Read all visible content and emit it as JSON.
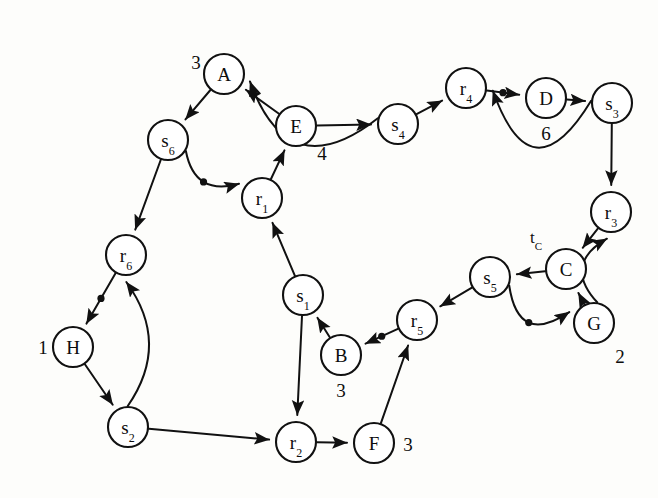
{
  "figure": {
    "width": 658,
    "height": 498,
    "background_color": "#fdfdfb",
    "stroke_color": "#111111"
  },
  "nodes": [
    {
      "id": "A",
      "label": "A",
      "sub": "",
      "x": 224,
      "y": 74,
      "r": 20
    },
    {
      "id": "s6",
      "label": "s",
      "sub": "6",
      "x": 168,
      "y": 140,
      "r": 20
    },
    {
      "id": "E",
      "label": "E",
      "sub": "",
      "x": 296,
      "y": 126,
      "r": 20
    },
    {
      "id": "s4",
      "label": "s",
      "sub": "4",
      "x": 398,
      "y": 124,
      "r": 20
    },
    {
      "id": "r4",
      "label": "r",
      "sub": "4",
      "x": 466,
      "y": 88,
      "r": 20
    },
    {
      "id": "D",
      "label": "D",
      "sub": "",
      "x": 546,
      "y": 98,
      "r": 20
    },
    {
      "id": "s3",
      "label": "s",
      "sub": "3",
      "x": 612,
      "y": 103,
      "r": 20
    },
    {
      "id": "r3",
      "label": "r",
      "sub": "3",
      "x": 611,
      "y": 212,
      "r": 20
    },
    {
      "id": "C",
      "label": "C",
      "sub": "",
      "x": 566,
      "y": 269,
      "r": 20
    },
    {
      "id": "s5",
      "label": "s",
      "sub": "5",
      "x": 490,
      "y": 277,
      "r": 20
    },
    {
      "id": "G",
      "label": "G",
      "sub": "",
      "x": 594,
      "y": 323,
      "r": 20
    },
    {
      "id": "r1",
      "label": "r",
      "sub": "1",
      "x": 262,
      "y": 198,
      "r": 20
    },
    {
      "id": "r6",
      "label": "r",
      "sub": "6",
      "x": 126,
      "y": 255,
      "r": 20
    },
    {
      "id": "H",
      "label": "H",
      "sub": "",
      "x": 73,
      "y": 347,
      "r": 20
    },
    {
      "id": "s2",
      "label": "s",
      "sub": "2",
      "x": 128,
      "y": 427,
      "r": 20
    },
    {
      "id": "s1",
      "label": "s",
      "sub": "1",
      "x": 303,
      "y": 295,
      "r": 20
    },
    {
      "id": "B",
      "label": "B",
      "sub": "",
      "x": 341,
      "y": 355,
      "r": 20
    },
    {
      "id": "r5",
      "label": "r",
      "sub": "5",
      "x": 417,
      "y": 320,
      "r": 20
    },
    {
      "id": "r2",
      "label": "r",
      "sub": "2",
      "x": 296,
      "y": 442,
      "r": 20
    },
    {
      "id": "F",
      "label": "F",
      "sub": "",
      "x": 374,
      "y": 443,
      "r": 20
    }
  ],
  "annotations": [
    {
      "id": "ann-A",
      "text": "3",
      "x": 196,
      "y": 62,
      "node": "A"
    },
    {
      "id": "ann-E",
      "text": "4",
      "x": 322,
      "y": 153,
      "node": "E"
    },
    {
      "id": "ann-D",
      "text": "6",
      "x": 546,
      "y": 133,
      "node": "D"
    },
    {
      "id": "ann-H",
      "text": "1",
      "x": 43,
      "y": 347,
      "node": "H"
    },
    {
      "id": "ann-B",
      "text": "3",
      "x": 341,
      "y": 390,
      "node": "B"
    },
    {
      "id": "ann-F",
      "text": "3",
      "x": 408,
      "y": 444,
      "node": "F"
    },
    {
      "id": "ann-G",
      "text": "2",
      "x": 620,
      "y": 356,
      "node": "G"
    }
  ],
  "tags": [
    {
      "id": "tag-C",
      "text": "t",
      "sub": "C",
      "x": 536,
      "y": 237,
      "node": "C"
    }
  ],
  "edges": [
    {
      "id": "A-s6",
      "from": "A",
      "to": "s6",
      "dot": false
    },
    {
      "id": "s6-r1",
      "from": "s6",
      "to": "r1",
      "dot": true
    },
    {
      "id": "s6-r6",
      "from": "s6",
      "to": "r6",
      "dot": false
    },
    {
      "id": "E-A",
      "from": "E",
      "to": "A",
      "dot": false
    },
    {
      "id": "r1-E",
      "from": "r1",
      "to": "E",
      "dot": false
    },
    {
      "id": "E-s4",
      "from": "E",
      "to": "s4",
      "dot": false
    },
    {
      "id": "s4-A",
      "from": "s4",
      "to": "A",
      "dot": false
    },
    {
      "id": "s4-r4",
      "from": "s4",
      "to": "r4",
      "dot": false
    },
    {
      "id": "r4-D",
      "from": "r4",
      "to": "D",
      "dot": true
    },
    {
      "id": "D-s3",
      "from": "D",
      "to": "s3",
      "dot": false
    },
    {
      "id": "s3-r4",
      "from": "s3",
      "to": "r4",
      "dot": false
    },
    {
      "id": "s3-r3",
      "from": "s3",
      "to": "r3",
      "dot": false
    },
    {
      "id": "r3-C",
      "from": "r3",
      "to": "C",
      "dot": false
    },
    {
      "id": "C-s5",
      "from": "C",
      "to": "s5",
      "dot": false
    },
    {
      "id": "G-C",
      "from": "G",
      "to": "C",
      "dot": false
    },
    {
      "id": "G-r3",
      "from": "G",
      "to": "r3",
      "dot": false
    },
    {
      "id": "s5-G",
      "from": "s5",
      "to": "G",
      "dot": true
    },
    {
      "id": "s5-r5",
      "from": "s5",
      "to": "r5",
      "dot": false
    },
    {
      "id": "r5-B",
      "from": "r5",
      "to": "B",
      "dot": true
    },
    {
      "id": "B-s1",
      "from": "B",
      "to": "s1",
      "dot": false
    },
    {
      "id": "s1-r1",
      "from": "s1",
      "to": "r1",
      "dot": false
    },
    {
      "id": "s1-r2",
      "from": "s1",
      "to": "r2",
      "dot": false
    },
    {
      "id": "r6-H",
      "from": "r6",
      "to": "H",
      "dot": true
    },
    {
      "id": "H-s2",
      "from": "H",
      "to": "s2",
      "dot": false
    },
    {
      "id": "s2-r6",
      "from": "s2",
      "to": "r6",
      "dot": false
    },
    {
      "id": "s2-r2",
      "from": "s2",
      "to": "r2",
      "dot": false
    },
    {
      "id": "r2-F",
      "from": "r2",
      "to": "F",
      "dot": false
    },
    {
      "id": "F-r5",
      "from": "F",
      "to": "r5",
      "dot": false
    }
  ]
}
